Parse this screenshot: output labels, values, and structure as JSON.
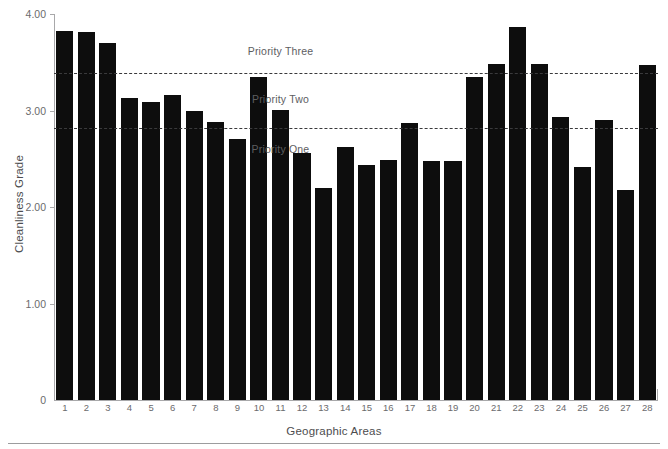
{
  "chart_data": {
    "type": "bar",
    "title": "",
    "xlabel": "Geographic Areas",
    "ylabel": "Cleanliness Grade",
    "categories": [
      "1",
      "2",
      "3",
      "4",
      "5",
      "6",
      "7",
      "8",
      "9",
      "10",
      "11",
      "12",
      "13",
      "14",
      "15",
      "16",
      "17",
      "18",
      "19",
      "20",
      "21",
      "22",
      "23",
      "24",
      "25",
      "26",
      "27",
      "28"
    ],
    "values": [
      3.82,
      3.81,
      3.7,
      3.13,
      3.09,
      3.16,
      3.0,
      2.88,
      2.71,
      3.35,
      3.01,
      2.56,
      2.2,
      2.62,
      2.44,
      2.49,
      2.87,
      2.48,
      2.48,
      3.35,
      3.48,
      3.87,
      3.48,
      2.93,
      2.41,
      2.9,
      2.18,
      3.47
    ],
    "ylim": [
      0,
      4.0
    ],
    "ytick_labels": [
      "0",
      "1.00",
      "2.00",
      "3.00",
      "4.00"
    ],
    "ytick_values": [
      0,
      1.0,
      2.0,
      3.0,
      4.0
    ],
    "grid": false,
    "legend": "none",
    "bar_color": "#0d0d0d",
    "axis_color": "#a8a8aa",
    "threshold_color": "#3a3a3c",
    "thresholds": [
      {
        "label": "Priority Three",
        "value": 3.39,
        "annotation_value": 3.62,
        "annotation_x_category": 11
      },
      {
        "label": "Priority Two",
        "value": 2.82,
        "annotation_value": 3.12,
        "annotation_x_category": 11
      },
      {
        "label": "Priority One",
        "value": null,
        "annotation_value": 2.6,
        "annotation_x_category": 11
      }
    ],
    "annotations": [
      {
        "text": "Priority Three",
        "x": 11,
        "y": 3.62
      },
      {
        "text": "Priority Two",
        "x": 11,
        "y": 3.12
      },
      {
        "text": "Priority One",
        "x": 11,
        "y": 2.6
      }
    ]
  }
}
